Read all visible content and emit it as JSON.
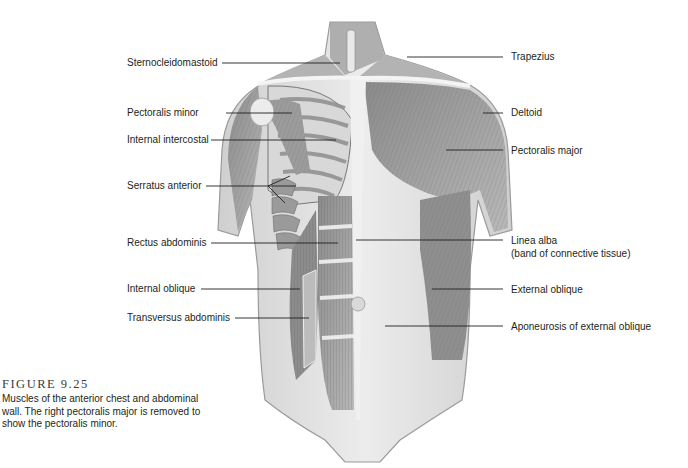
{
  "figure": {
    "number": "FIGURE 9.25",
    "caption": "Muscles of the anterior chest and abdominal wall. The right pectoralis major is removed to show the pectoralis minor."
  },
  "labels": {
    "left": [
      {
        "id": "sternocleidomastoid",
        "text": "Sternocleidomastoid"
      },
      {
        "id": "pectoralis-minor",
        "text": "Pectoralis minor"
      },
      {
        "id": "internal-intercostal",
        "text": "Internal intercostal"
      },
      {
        "id": "serratus-anterior",
        "text": "Serratus anterior"
      },
      {
        "id": "rectus-abdominis",
        "text": "Rectus abdominis"
      },
      {
        "id": "internal-oblique",
        "text": "Internal oblique"
      },
      {
        "id": "transversus-abdominis",
        "text": "Transversus abdominis"
      }
    ],
    "right": [
      {
        "id": "trapezius",
        "text": "Trapezius"
      },
      {
        "id": "deltoid",
        "text": "Deltoid"
      },
      {
        "id": "pectoralis-major",
        "text": "Pectoralis major"
      },
      {
        "id": "linea-alba",
        "text": "Linea alba",
        "subtext": "(band of connective tissue)"
      },
      {
        "id": "external-oblique",
        "text": "External oblique"
      },
      {
        "id": "aponeurosis-external-oblique",
        "text": "Aponeurosis of external oblique"
      }
    ]
  },
  "colors": {
    "background": "#ffffff",
    "text": "#231f20",
    "leader_line": "#231f20",
    "skin": "#e6e6e6",
    "muscle_dark": "#7a7a7a",
    "muscle_mid": "#a6a6a6",
    "fascia": "#f2f2f2"
  }
}
